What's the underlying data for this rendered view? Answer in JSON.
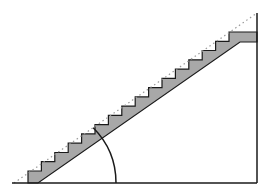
{
  "diagram": {
    "colors": {
      "background": "#ffffff",
      "line": "#1a1a1a",
      "stair_fill": "#a8a8a8",
      "dotted_pitch_line": "#9a9a9a"
    },
    "baseline": {
      "x1": 12,
      "y1": 183,
      "x2": 257,
      "y2": 183
    },
    "vertical_line": {
      "x1": 257,
      "y1": 13,
      "x2": 257,
      "y2": 183
    },
    "pitch_line": {
      "x1": 14,
      "y1": 183,
      "x2": 257,
      "y2": 13,
      "style": "dotted"
    },
    "stairs": {
      "riser_count": 16,
      "start": {
        "x": 28,
        "y": 183
      },
      "first_tread_y": 171,
      "top_landing": {
        "x1": 229,
        "x2": 257,
        "top_y": 32,
        "bottom_y": 42
      },
      "stringer_bottom": {
        "x1": 38,
        "y1": 183,
        "x2": 240,
        "y2": 42
      }
    },
    "angle_arc": {
      "cx": 38,
      "cy": 183,
      "r": 78,
      "start_deg": 0,
      "end_deg": 45,
      "label": ""
    }
  }
}
